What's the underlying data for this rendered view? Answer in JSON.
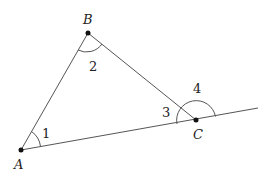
{
  "diagram": {
    "type": "triangle-with-exterior-angle",
    "points": [
      {
        "name": "A",
        "x": 21,
        "y": 150
      },
      {
        "name": "B",
        "x": 88,
        "y": 33
      },
      {
        "name": "C",
        "x": 196,
        "y": 120
      }
    ],
    "extension_end": {
      "x": 258,
      "y": 108
    },
    "vertex_labels": {
      "A": "A",
      "B": "B",
      "C": "C"
    },
    "angle_labels": {
      "a1": "1",
      "a2": "2",
      "a3": "3",
      "a4": "4"
    },
    "colors": {
      "line": "#555555",
      "point": "#111111",
      "text": "#222222"
    }
  }
}
